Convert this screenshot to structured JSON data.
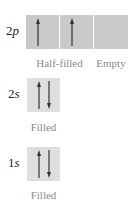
{
  "diagram": {
    "type": "orbital_box_diagram",
    "levels": [
      {
        "id": "2p",
        "number": "2",
        "letter": "p",
        "orbitals": [
          {
            "electrons": [
              "up"
            ]
          },
          {
            "electrons": [
              "up"
            ]
          },
          {
            "electrons": []
          }
        ],
        "captions": [
          "Half-filled",
          "Empty"
        ]
      },
      {
        "id": "2s",
        "number": "2",
        "letter": "s",
        "orbitals": [
          {
            "electrons": [
              "up",
              "down"
            ]
          }
        ],
        "captions": [
          "Filled"
        ]
      },
      {
        "id": "1s",
        "number": "1",
        "letter": "s",
        "orbitals": [
          {
            "electrons": [
              "up",
              "down"
            ]
          }
        ],
        "captions": [
          "Filled"
        ]
      }
    ],
    "colors": {
      "p_box": "#c9c9c9",
      "s_box": "#dedede",
      "arrow": "#333333",
      "caption": "#8a8a8a"
    }
  }
}
